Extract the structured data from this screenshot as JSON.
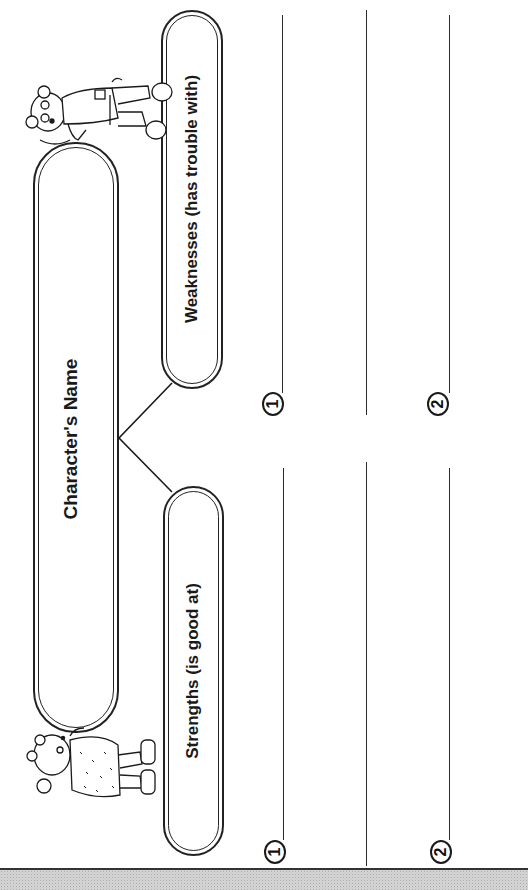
{
  "worksheet": {
    "orientation": "rotated -90deg (landscape printed sideways)",
    "center_box": {
      "label": "Character's Name"
    },
    "strengths": {
      "label": "Strengths (is good at)",
      "items": [
        {
          "number": "1"
        },
        {
          "number": "2"
        }
      ]
    },
    "weaknesses": {
      "label": "Weaknesses (has trouble with)",
      "items": [
        {
          "number": "1"
        },
        {
          "number": "2"
        }
      ]
    },
    "illustrations": {
      "top": "bear-boy-character",
      "bottom": "bear-girl-character"
    },
    "colors": {
      "ink": "#1a1a1a",
      "paper": "#ffffff",
      "footer_band": "#d6d6d6"
    }
  }
}
